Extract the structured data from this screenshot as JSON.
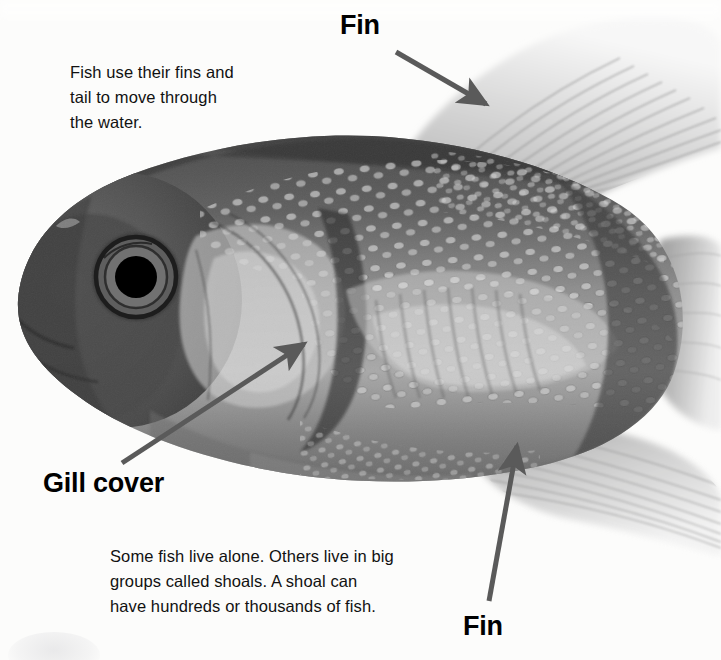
{
  "page": {
    "kind": "illustrated-book-page",
    "background_color": "#fcfcfb"
  },
  "photo": {
    "description": "black and white photograph of a goldfish facing left",
    "eye_pupil_color": "#000000",
    "body_tone_dark": "#4a4a4a",
    "body_tone_mid": "#8b8b8b",
    "body_tone_light": "#d9d9d9",
    "fin_tone": "#b9b9b9"
  },
  "annotations": {
    "arrow_color": "#5a5a5a",
    "items": [
      {
        "id": "fin-dorsal",
        "label": "Fin",
        "label_left": 340,
        "label_top": 12,
        "arrow_from": [
          396,
          52
        ],
        "arrow_to": [
          488,
          106
        ]
      },
      {
        "id": "gill-cover",
        "label": "Gill cover",
        "label_left": 43,
        "label_top": 470,
        "arrow_from": [
          122,
          463
        ],
        "arrow_to": [
          306,
          342
        ]
      },
      {
        "id": "fin-anal",
        "label": "Fin",
        "label_left": 463,
        "label_top": 613,
        "arrow_from": [
          489,
          601
        ],
        "arrow_to": [
          518,
          442
        ]
      }
    ]
  },
  "text_blocks": {
    "fins": "Fish use their fins and\ntail to move through\nthe water.",
    "shoals": "Some fish live alone. Others live in big\ngroups called shoals. A shoal can\nhave hundreds or thousands of fish."
  }
}
